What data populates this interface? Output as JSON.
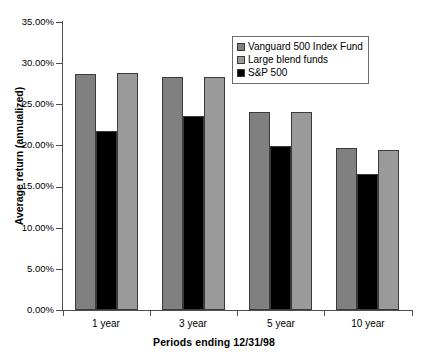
{
  "chart_data": {
    "type": "bar",
    "title": "",
    "xlabel": "Periods ending 12/31/98",
    "ylabel": "Average return (annualized)",
    "categories": [
      "1 year",
      "3 year",
      "5 year",
      "10 year"
    ],
    "series": [
      {
        "name": "Vanguard 500 Index Fund",
        "color": "#808080",
        "values": [
          28.7,
          28.3,
          24.1,
          19.7
        ]
      },
      {
        "name": "Large blend funds",
        "color": "#000000",
        "values": [
          21.8,
          23.6,
          19.9,
          16.5
        ]
      },
      {
        "name": "S&P 500",
        "color": "#9a9a9a",
        "values": [
          28.8,
          28.3,
          24.1,
          19.4
        ]
      }
    ],
    "legend": [
      "Vanguard 500 Index Fund",
      "Large blend funds",
      "S&P 500"
    ],
    "legend_position": "top-right",
    "ylim": [
      0,
      35
    ],
    "ytick_values": [
      0,
      5,
      10,
      15,
      20,
      25,
      30,
      35
    ],
    "ytick_labels": [
      "0.00%",
      "5.00%",
      "10.00%",
      "15.00%",
      "20.00%",
      "25.00%",
      "30.00%",
      "35.00%"
    ],
    "grid": false,
    "value_format": "percent"
  },
  "legend": {
    "items": [
      {
        "label": "Vanguard 500 Index Fund",
        "swatch": "#808080"
      },
      {
        "label": "Large blend funds",
        "swatch": "#9a9a9a"
      },
      {
        "label": "S&P 500",
        "swatch": "#000000"
      }
    ]
  },
  "axes": {
    "x_title": "Periods ending 12/31/98",
    "y_title": "Average return (annualized)"
  }
}
